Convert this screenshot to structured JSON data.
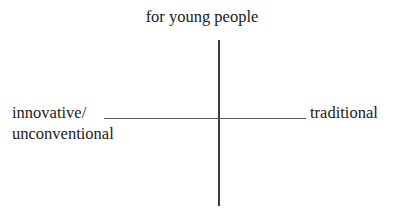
{
  "diagram": {
    "type": "two-axis-positioning-grid",
    "background_color": "#ffffff",
    "axis_color_vertical": "#3a3a3c",
    "axis_color_horizontal": "#5a5a5e",
    "text_color": "#1a1a1a",
    "top_crop_remnant": "",
    "labels": {
      "top": "for young people",
      "left_line_1": "innovative/",
      "left_line_2": "unconventional",
      "right": "traditional",
      "bottom": ""
    }
  }
}
